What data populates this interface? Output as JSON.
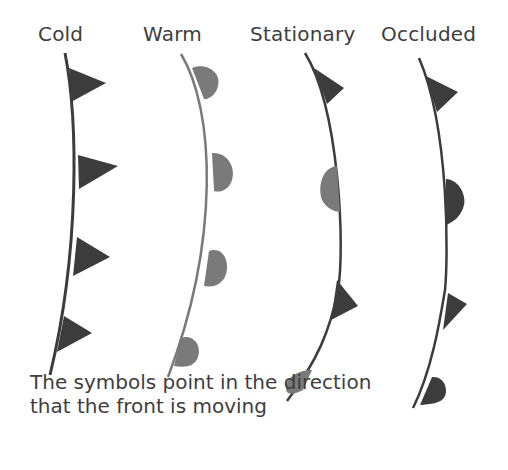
{
  "labels": {
    "cold": "Cold",
    "warm": "Warm",
    "stationary": "Stationary",
    "occluded": "Occluded"
  },
  "caption": {
    "line1": "The symbols point in the direction",
    "line2": "that the front is moving"
  },
  "colors": {
    "dark": "#3c3c3c",
    "light": "#7a7a7a",
    "text": "#3e3e3e"
  },
  "fronts": [
    {
      "name": "Cold",
      "symbols": [
        "triangle",
        "triangle",
        "triangle",
        "triangle"
      ]
    },
    {
      "name": "Warm",
      "symbols": [
        "semicircle",
        "semicircle",
        "semicircle",
        "semicircle"
      ]
    },
    {
      "name": "Stationary",
      "symbols": [
        "triangle",
        "semicircle",
        "triangle",
        "semicircle"
      ]
    },
    {
      "name": "Occluded",
      "symbols": [
        "triangle",
        "semicircle",
        "triangle",
        "semicircle"
      ]
    }
  ]
}
